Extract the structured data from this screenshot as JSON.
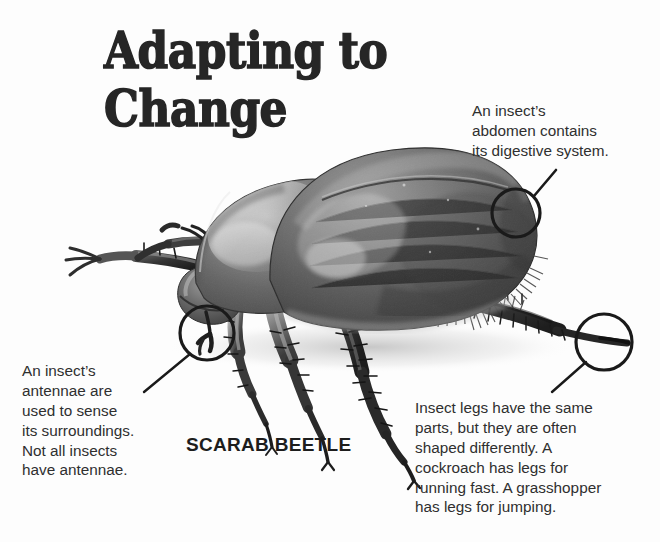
{
  "page": {
    "background_color": "#fdfdfd",
    "width": 660,
    "height": 542
  },
  "title": {
    "line1": "Adapting to",
    "line2": "Change",
    "color": "#262626"
  },
  "figure": {
    "caption": "SCARAB BEETLE",
    "palette": {
      "elytra_dark": "#4c4c4c",
      "elytra_mid": "#6e6e6e",
      "highlight": "#c9c9c9",
      "pronotum": "#7a7a7a",
      "leg_dark": "#2b2b2b",
      "shadow": "#9a9a9a",
      "outline": "#1c1c1c"
    }
  },
  "callouts": [
    {
      "id": "abdomen",
      "text": "An insect’s abdomen contains its digestive system.",
      "lines": [
        "An insect’s",
        "abdomen contains",
        "its digestive system."
      ],
      "circle": {
        "cx": 516,
        "cy": 213,
        "r": 24
      },
      "leader": {
        "x1": 534,
        "y1": 196,
        "x2": 556,
        "y2": 170
      }
    },
    {
      "id": "antennae",
      "text": "An insect’s antennae are used to sense its surroundings. Not all insects have antennae.",
      "lines": [
        "An insect’s",
        "antennae are",
        "used to sense",
        "its surroundings.",
        "Not all insects",
        "have antennae."
      ],
      "circle": {
        "cx": 207,
        "cy": 333,
        "r": 27
      },
      "leader": {
        "x1": 190,
        "y1": 354,
        "x2": 144,
        "y2": 392
      }
    },
    {
      "id": "legs",
      "text": "Insect legs have the same parts, but they are often shaped differently. A cockroach has legs for running fast. A grasshopper has legs for jumping.",
      "lines": [
        "Insect legs have the same",
        "parts, but they are often",
        "shaped differently. A",
        "cockroach has legs for",
        "running fast. A grasshopper",
        "has legs for jumping."
      ],
      "circle": {
        "cx": 604,
        "cy": 342,
        "r": 28
      },
      "leader": {
        "x1": 586,
        "y1": 362,
        "x2": 552,
        "y2": 392
      }
    }
  ],
  "annotation_style": {
    "stroke_color": "#1a1a1a",
    "circle_stroke_width": 3.2,
    "leader_stroke_width": 2.4
  }
}
